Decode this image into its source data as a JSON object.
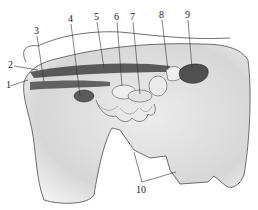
{
  "figure": {
    "type": "anatomical-illustration",
    "labels": [
      {
        "id": "1",
        "text": "1",
        "x": 6,
        "y": 84
      },
      {
        "id": "2",
        "text": "2",
        "x": 8,
        "y": 62
      },
      {
        "id": "3",
        "text": "3",
        "x": 34,
        "y": 26
      },
      {
        "id": "4",
        "text": "4",
        "x": 68,
        "y": 14
      },
      {
        "id": "5",
        "text": "5",
        "x": 94,
        "y": 12
      },
      {
        "id": "6",
        "text": "6",
        "x": 114,
        "y": 12
      },
      {
        "id": "7",
        "text": "7",
        "x": 130,
        "y": 12
      },
      {
        "id": "8",
        "text": "8",
        "x": 159,
        "y": 10
      },
      {
        "id": "9",
        "text": "9",
        "x": 185,
        "y": 10
      },
      {
        "id": "10",
        "text": "10",
        "x": 136,
        "y": 185
      }
    ],
    "colors": {
      "outline": "#4a4a4a",
      "body_fill": "#dcdcdc",
      "organ_dark": "#5a5a5a",
      "organ_light": "#eeeeee",
      "spine_dark": "#3a3a3a"
    }
  }
}
